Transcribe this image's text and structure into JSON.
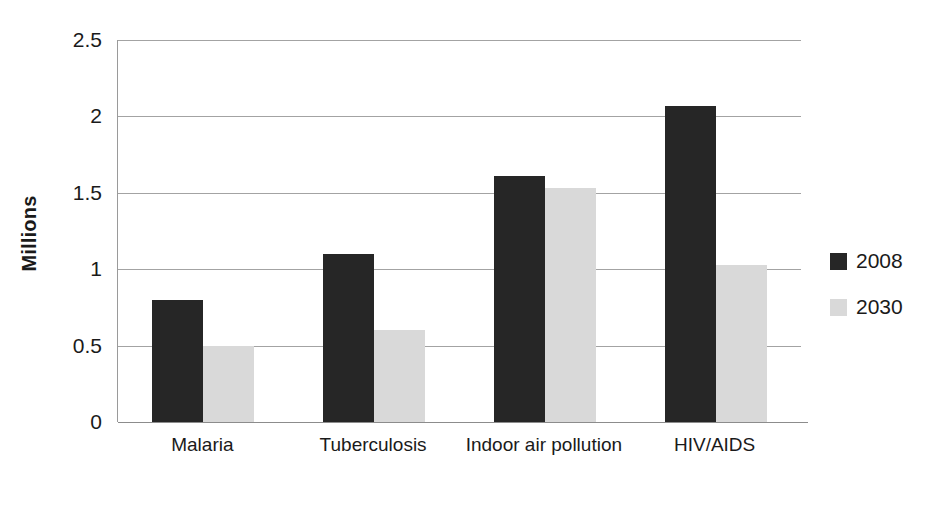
{
  "chart_data": {
    "type": "bar",
    "title": "",
    "xlabel": "",
    "ylabel": "Millions",
    "categories": [
      "Malaria",
      "Tuberculosis",
      "Indoor air pollution",
      "HIV/AIDS"
    ],
    "series": [
      {
        "name": "2008",
        "color": "#262626",
        "values": [
          0.8,
          1.1,
          1.61,
          2.07
        ]
      },
      {
        "name": "2030",
        "color": "#d9d9d9",
        "values": [
          0.5,
          0.6,
          1.53,
          1.03
        ]
      }
    ],
    "ylim": [
      0,
      2.5
    ],
    "yticks": [
      0,
      0.5,
      1,
      1.5,
      2,
      2.5
    ],
    "ytick_labels": [
      "0",
      "0.5",
      "1",
      "1.5",
      "2",
      "2.5"
    ],
    "grid": true,
    "legend_position": "right",
    "background_color": "#ffffff",
    "gridline_color": "#a3a3a3"
  },
  "legend": {
    "entries": [
      {
        "label": "2008"
      },
      {
        "label": "2030"
      }
    ]
  },
  "axis": {
    "y_title": "Millions"
  }
}
